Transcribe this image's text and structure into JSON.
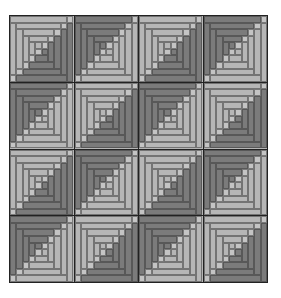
{
  "quilt": {
    "title": "Log cabin quilt pattern",
    "rows": 4,
    "cols": 4,
    "rings": 4,
    "colors": {
      "light": "#b6b6b6",
      "dark": "#7b7b7b",
      "lighter_corner": "#c4c4c4",
      "darker_center": "#6e6e6e",
      "grid_line": "#222222",
      "background": "#ffffff"
    },
    "layout": [
      [
        "light",
        "dark",
        "light",
        "dark"
      ],
      [
        "dark",
        "light",
        "dark",
        "light"
      ],
      [
        "light",
        "dark",
        "light",
        "dark"
      ],
      [
        "dark",
        "light",
        "dark",
        "light"
      ]
    ]
  }
}
